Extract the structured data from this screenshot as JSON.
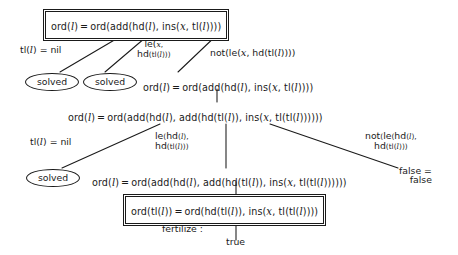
{
  "diagram": {
    "kind": "proof-tree",
    "colors": {
      "ink": "#1a1a1a",
      "background": "#ffffff"
    }
  },
  "nodes": {
    "root": {
      "text": "ord(l) = ord(add(hd(l), ins(x, tl(l))))",
      "style": "boxed-double"
    },
    "solved_1": {
      "text": "solved",
      "style": "ellipse"
    },
    "solved_2": {
      "text": "solved",
      "style": "ellipse"
    },
    "goal_2": {
      "text": "ord(l) = ord(add(hd(l), ins(x, tl(l))))",
      "style": "plain"
    },
    "goal_3": {
      "text": "ord(l) = ord(add(hd(l), add(hd(tl(l)), ins(x, tl(tl(l))))))",
      "style": "plain"
    },
    "solved_3": {
      "text": "solved",
      "style": "ellipse"
    },
    "goal_4": {
      "text": "ord(l) = ord(add(hd(l), add(hd(tl(l)), ins(x, tl(tl(l))))))",
      "style": "plain"
    },
    "false_eq": {
      "line1": "false =",
      "line2": "false",
      "style": "plain"
    },
    "leaf_boxed": {
      "text": "ord(tl(l)) = ord(hd(tl(l)), ins(x, tl(tl(l))))",
      "style": "boxed-double"
    },
    "true_leaf": {
      "text": "true",
      "style": "plain"
    }
  },
  "edge_labels": {
    "tl_nil_upper": "tl(l) = nil",
    "le_x_hd": {
      "line1": "le(x,",
      "line2": "hd(tl(l)))"
    },
    "not_le_x_hd": "not(le(x, hd(tl(l))))",
    "tl_nil_lower": "tl(l) = nil",
    "le_hd_hd": {
      "line1": "le(hd(l),",
      "line2": "hd(tl(l)))"
    },
    "not_le_hd_hd": {
      "line1": "not(le(hd(l),",
      "line2": "hd(tl(l))))"
    },
    "fertilize": "fertilize :"
  }
}
